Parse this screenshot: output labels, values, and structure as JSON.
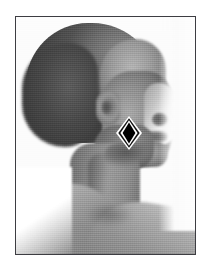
{
  "figure": {
    "kind": "photograph",
    "view": "right lateral profile",
    "color_mode": "grayscale",
    "frame": {
      "border_color": "#3d3d42",
      "border_width_px": 1.5,
      "background_color": "#ffffff",
      "inner_background_color": "#fdfdfd"
    },
    "annotation": {
      "shape": "diamond",
      "fill_color": "#000000",
      "outline_color": "#ffffff",
      "outline_inner_color": "#1a1a1a",
      "location": "cheek"
    },
    "tones": {
      "hair": "#4a4a4a",
      "face": "#8f8f8f",
      "highlight": "#cfcfcf",
      "shadow": "#3a3a3a",
      "background": "#ffffff"
    }
  }
}
